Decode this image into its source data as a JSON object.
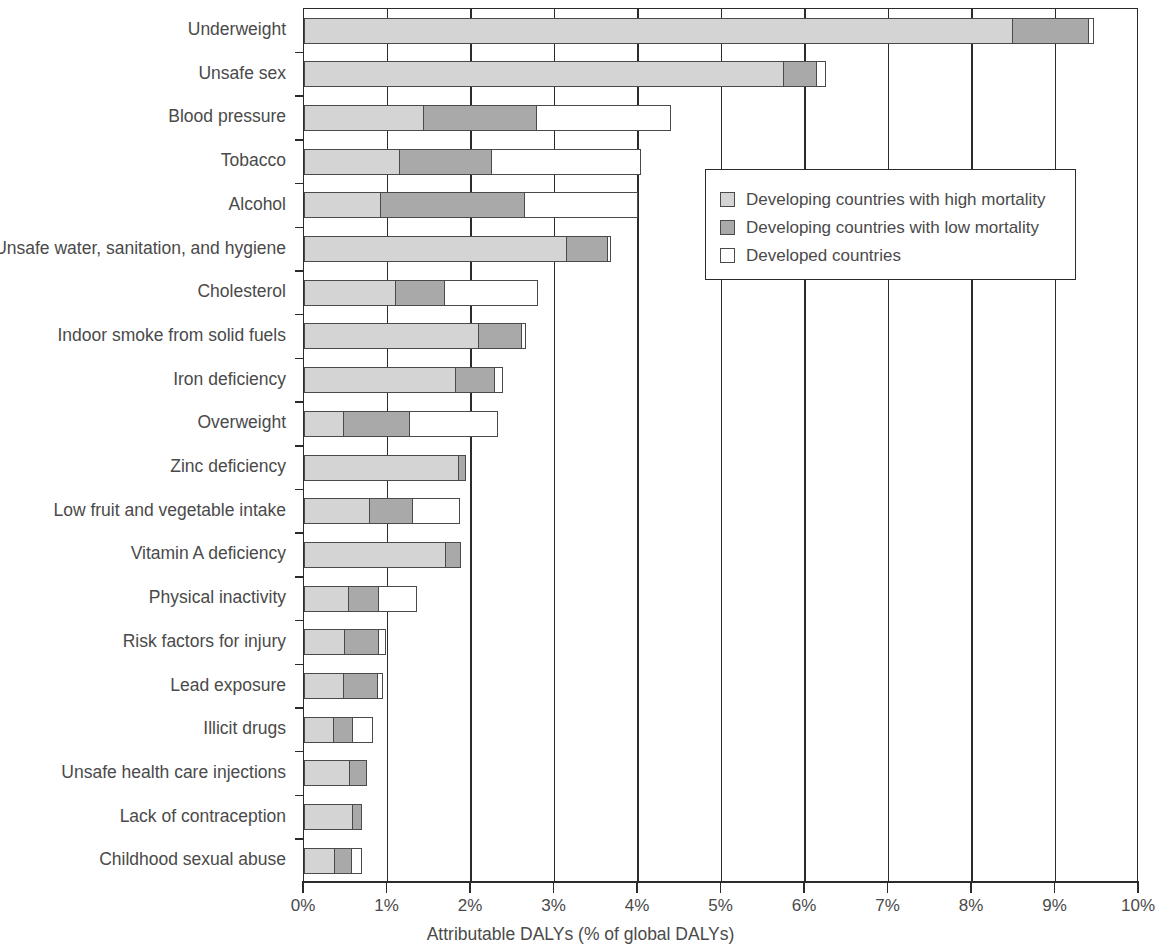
{
  "chart_data": {
    "type": "bar",
    "orientation": "horizontal",
    "stacked": true,
    "title": "",
    "xlabel": "Attributable DALYs (% of global DALYs)",
    "ylabel": "",
    "xlim": [
      0,
      10
    ],
    "xticks": [
      0,
      1,
      2,
      3,
      4,
      5,
      6,
      7,
      8,
      9,
      10
    ],
    "xticklabels": [
      "0%",
      "1%",
      "2%",
      "3%",
      "4%",
      "5%",
      "6%",
      "7%",
      "8%",
      "9%",
      "10%"
    ],
    "grid": "vertical",
    "legend_position": "inside-upper-right",
    "categories": [
      "Underweight",
      "Unsafe sex",
      "Blood pressure",
      "Tobacco",
      "Alcohol",
      "Unsafe water, sanitation, and hygiene",
      "Cholesterol",
      "Indoor smoke from solid fuels",
      "Iron deficiency",
      "Overweight",
      "Zinc deficiency",
      "Low fruit and vegetable intake",
      "Vitamin A deficiency",
      "Physical inactivity",
      "Risk factors for injury",
      "Lead exposure",
      "Illicit drugs",
      "Unsafe health care injections",
      "Lack of contraception",
      "Childhood sexual abuse"
    ],
    "series": [
      {
        "name": "Developing countries with high mortality",
        "color": "#d4d4d4",
        "values": [
          8.5,
          5.75,
          1.44,
          1.16,
          0.93,
          3.15,
          1.11,
          2.1,
          1.82,
          0.48,
          1.86,
          0.79,
          1.71,
          0.54,
          0.5,
          0.48,
          0.36,
          0.56,
          0.59,
          0.38
        ]
      },
      {
        "name": "Developing countries with low mortality",
        "color": "#a9a9a9",
        "values": [
          0.9,
          0.4,
          1.36,
          1.1,
          1.72,
          0.49,
          0.58,
          0.52,
          0.47,
          0.79,
          0.08,
          0.52,
          0.17,
          0.36,
          0.4,
          0.41,
          0.23,
          0.2,
          0.1,
          0.2
        ]
      },
      {
        "name": "Developed countries",
        "color": "#ffffff",
        "values": [
          0.06,
          0.1,
          1.59,
          1.78,
          1.35,
          0.04,
          1.11,
          0.04,
          0.09,
          1.05,
          0.0,
          0.56,
          0.0,
          0.45,
          0.08,
          0.06,
          0.24,
          0.0,
          0.0,
          0.12
        ]
      }
    ],
    "totals": [
      9.46,
      6.25,
      4.39,
      4.04,
      4.0,
      3.68,
      2.8,
      2.66,
      2.38,
      2.32,
      1.94,
      1.87,
      1.88,
      1.35,
      0.98,
      0.95,
      0.83,
      0.76,
      0.69,
      0.7
    ]
  },
  "legend": {
    "items": [
      {
        "label": "Developing countries with high mortality",
        "swatch": "high"
      },
      {
        "label": "Developing countries with low mortality",
        "swatch": "low"
      },
      {
        "label": "Developed countries",
        "swatch": "dev"
      }
    ]
  }
}
